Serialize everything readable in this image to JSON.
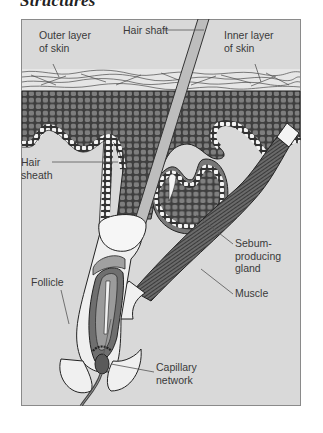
{
  "heading": "Structures",
  "figure": {
    "type": "anatomical cross-section diagram",
    "colors": {
      "background": "#d9d9d9",
      "frame": "#8a8a8a",
      "dermis_cells": "#4a4a4a",
      "cell_fill": "#7c7c7c",
      "hair_shaft": "#bdbdbd",
      "light_tissue": "#f2f2f2",
      "dark_tissue": "#6f6f6f",
      "leader_line": "#555555",
      "label_text": "#3a3a3a"
    },
    "labels": [
      {
        "id": "outer-layer",
        "text": "Outer layer\nof skin"
      },
      {
        "id": "hair-shaft",
        "text": "Hair shaft"
      },
      {
        "id": "inner-layer",
        "text": "Inner layer\nof skin"
      },
      {
        "id": "hair-sheath",
        "text": "Hair\nsheath"
      },
      {
        "id": "sebum-gland",
        "text": "Sebum-\nproducing\ngland"
      },
      {
        "id": "muscle",
        "text": "Muscle"
      },
      {
        "id": "follicle",
        "text": "Follicle"
      },
      {
        "id": "capillary",
        "text": "Capillary\nnetwork"
      }
    ]
  }
}
